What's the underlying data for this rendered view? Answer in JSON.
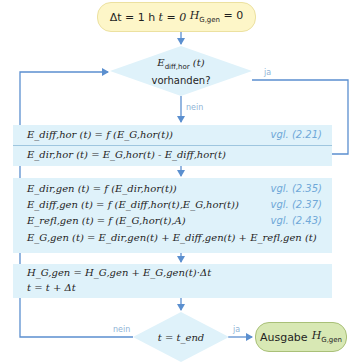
{
  "start": {
    "dt_label": "Δt = 1 h",
    "t_label": "t = 0",
    "H_label": "H",
    "H_sub": "G,gen",
    "H_value": "= 0"
  },
  "decision1": {
    "expr_main": "E",
    "expr_sub": "diff,hor",
    "expr_arg": "(t)",
    "question": "vorhanden?",
    "yes_label": "ja",
    "no_label": "nein"
  },
  "box1": {
    "rows": [
      {
        "text": "E_diff,hor (t) = f (E_G,hor(t))",
        "ref": "vgl. (2.21)"
      },
      {
        "text": "E_dir,hor (t) = E_G,hor(t) - E_diff,hor(t)",
        "ref": ""
      }
    ]
  },
  "box2": {
    "rows": [
      {
        "text": "E_dir,gen (t) = f (E_dir,hor(t))",
        "ref": "vgl. (2.35)"
      },
      {
        "text": "E_diff,gen (t) = f (E_diff,hor(t),E_G,hor(t))",
        "ref": "vgl. (2.37)"
      },
      {
        "text": "E_refl,gen (t) = f (E_G,hor(t),A)",
        "ref": "vgl. (2.43)"
      },
      {
        "text": "E_G,gen (t) = E_dir,gen(t) + E_diff,gen(t) + E_refl,gen (t)",
        "ref": ""
      }
    ]
  },
  "box3": {
    "rows": [
      {
        "text": "H_G,gen = H_G,gen + E_G,gen(t)·Δt"
      },
      {
        "text": "t = t + Δt"
      }
    ]
  },
  "decision2": {
    "expr": "t = t_end",
    "yes_label": "ja",
    "no_label": "nein"
  },
  "output": {
    "label": "Ausgabe",
    "var": "H",
    "var_sub": "G,gen"
  },
  "colors": {
    "arrow": "#5b8fcf",
    "box_fill": "#dff2fa",
    "start_fill": "#fdf6c8",
    "output_fill": "#d8e8b4",
    "ref_text": "#6fa8d8"
  }
}
